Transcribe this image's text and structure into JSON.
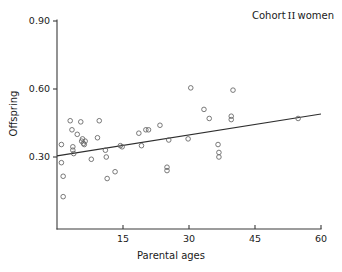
{
  "chart_data": {
    "type": "scatter",
    "title_prefix": "Cohort",
    "title_numeral": "II",
    "title_suffix": "women",
    "xlabel": "Parental ages",
    "ylabel": "Offspring",
    "xlim": [
      0,
      60
    ],
    "ylim": [
      0.0,
      0.9
    ],
    "xticks": [
      15,
      30,
      45,
      60
    ],
    "xtick_labels": [
      "15",
      "30",
      "45",
      "60"
    ],
    "yticks": [
      0.3,
      0.6,
      0.9
    ],
    "ytick_labels": [
      "0.30",
      "0.60",
      "0.90"
    ],
    "grid": false,
    "legend": "none",
    "marker": "open-circle",
    "marker_color": "#6a6a6a",
    "line_color": "#2e2e2e",
    "axis_color": "#3a3a3a",
    "points": [
      {
        "x": 1.0,
        "y": 0.355
      },
      {
        "x": 1.0,
        "y": 0.275
      },
      {
        "x": 1.4,
        "y": 0.215
      },
      {
        "x": 1.4,
        "y": 0.125
      },
      {
        "x": 3.0,
        "y": 0.46
      },
      {
        "x": 3.4,
        "y": 0.42
      },
      {
        "x": 3.6,
        "y": 0.33
      },
      {
        "x": 3.6,
        "y": 0.345
      },
      {
        "x": 3.8,
        "y": 0.315
      },
      {
        "x": 4.6,
        "y": 0.4
      },
      {
        "x": 5.4,
        "y": 0.455
      },
      {
        "x": 5.6,
        "y": 0.37
      },
      {
        "x": 5.8,
        "y": 0.38
      },
      {
        "x": 6.0,
        "y": 0.36
      },
      {
        "x": 6.2,
        "y": 0.355
      },
      {
        "x": 6.4,
        "y": 0.37
      },
      {
        "x": 7.8,
        "y": 0.29
      },
      {
        "x": 9.2,
        "y": 0.385
      },
      {
        "x": 9.6,
        "y": 0.46
      },
      {
        "x": 11.0,
        "y": 0.33
      },
      {
        "x": 11.2,
        "y": 0.3
      },
      {
        "x": 11.4,
        "y": 0.205
      },
      {
        "x": 13.2,
        "y": 0.235
      },
      {
        "x": 14.4,
        "y": 0.35
      },
      {
        "x": 14.8,
        "y": 0.345
      },
      {
        "x": 18.6,
        "y": 0.405
      },
      {
        "x": 19.2,
        "y": 0.35
      },
      {
        "x": 20.2,
        "y": 0.42
      },
      {
        "x": 20.8,
        "y": 0.42
      },
      {
        "x": 23.4,
        "y": 0.44
      },
      {
        "x": 25.0,
        "y": 0.255
      },
      {
        "x": 25.0,
        "y": 0.24
      },
      {
        "x": 25.4,
        "y": 0.375
      },
      {
        "x": 29.8,
        "y": 0.38
      },
      {
        "x": 30.4,
        "y": 0.605
      },
      {
        "x": 33.4,
        "y": 0.51
      },
      {
        "x": 34.6,
        "y": 0.47
      },
      {
        "x": 36.6,
        "y": 0.355
      },
      {
        "x": 36.8,
        "y": 0.32
      },
      {
        "x": 36.8,
        "y": 0.3
      },
      {
        "x": 39.6,
        "y": 0.48
      },
      {
        "x": 39.6,
        "y": 0.465
      },
      {
        "x": 40.0,
        "y": 0.595
      },
      {
        "x": 54.8,
        "y": 0.47
      }
    ],
    "fit_line": {
      "x_start": 0,
      "y_start": 0.305,
      "x_end": 60,
      "y_end": 0.49
    }
  }
}
